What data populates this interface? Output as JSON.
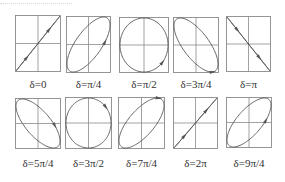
{
  "figure": {
    "colors": {
      "frame": "#8a8a8a",
      "axes": "#8a8a8a",
      "curve": "#555555",
      "text": "#333333"
    },
    "panels": [
      {
        "label": "δ=0",
        "phase": 0,
        "shape": "line-pos",
        "x": 15,
        "y": 15,
        "w": 46,
        "h": 57
      },
      {
        "label": "δ=π/4",
        "phase": 0.25,
        "shape": "ellipse-pos",
        "x": 66,
        "y": 16,
        "w": 45,
        "h": 57
      },
      {
        "label": "δ=π/2",
        "phase": 0.5,
        "shape": "circle",
        "x": 119,
        "y": 17,
        "w": 50,
        "h": 56
      },
      {
        "label": "δ=3π/4",
        "phase": 0.75,
        "shape": "ellipse-neg",
        "x": 173,
        "y": 17,
        "w": 46,
        "h": 56
      },
      {
        "label": "δ=π",
        "phase": 1,
        "shape": "line-neg",
        "x": 226,
        "y": 16,
        "w": 45,
        "h": 56
      },
      {
        "label": "δ=5π/4",
        "phase": 1.25,
        "shape": "ellipse-neg",
        "x": 15,
        "y": 98,
        "w": 46,
        "h": 51
      },
      {
        "label": "δ=3π/2",
        "phase": 1.5,
        "shape": "circle",
        "x": 65,
        "y": 97,
        "w": 47,
        "h": 52
      },
      {
        "label": "δ=7π/4",
        "phase": 1.75,
        "shape": "ellipse-pos",
        "x": 118,
        "y": 97,
        "w": 47,
        "h": 52
      },
      {
        "label": "δ=2π",
        "phase": 2,
        "shape": "line-pos",
        "x": 173,
        "y": 97,
        "w": 45,
        "h": 52
      },
      {
        "label": "δ=9π/4",
        "phase": 2.25,
        "shape": "ellipse-pos",
        "x": 226,
        "y": 97,
        "w": 46,
        "h": 51
      }
    ]
  }
}
